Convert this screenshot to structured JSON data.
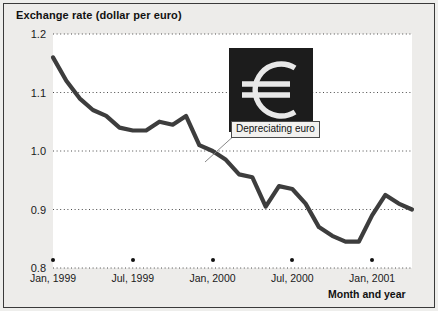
{
  "chart_data": {
    "type": "line",
    "title": "Exchange rate (dollar per euro)",
    "ylabel": "Exchange rate (dollar per euro)",
    "xlabel": "Month and year",
    "ylim": [
      0.8,
      1.2
    ],
    "yticks": [
      "0.8",
      "0.9",
      "1.0",
      "1.1",
      "1.2"
    ],
    "grid": true,
    "legend": "none",
    "xticks": [
      "Jan, 1999",
      "Jul, 1999",
      "Jan, 2000",
      "Jul, 2000",
      "Jan, 2001"
    ],
    "x": [
      "Jan, 1999",
      "Feb, 1999",
      "Mar, 1999",
      "Apr, 1999",
      "May, 1999",
      "Jun, 1999",
      "Jul, 1999",
      "Aug, 1999",
      "Sep, 1999",
      "Oct, 1999",
      "Nov, 1999",
      "Dec, 1999",
      "Jan, 2000",
      "Feb, 2000",
      "Mar, 2000",
      "Apr, 2000",
      "May, 2000",
      "Jun, 2000",
      "Jul, 2000",
      "Aug, 2000",
      "Sep, 2000",
      "Oct, 2000",
      "Nov, 2000",
      "Dec, 2000",
      "Jan, 2001",
      "Feb, 2001",
      "Mar, 2001",
      "Apr, 2001"
    ],
    "values": [
      1.16,
      1.12,
      1.09,
      1.07,
      1.06,
      1.04,
      1.035,
      1.035,
      1.05,
      1.045,
      1.06,
      1.01,
      1.0,
      0.985,
      0.96,
      0.955,
      0.905,
      0.94,
      0.935,
      0.91,
      0.87,
      0.855,
      0.845,
      0.845,
      0.89,
      0.925,
      0.91,
      0.9
    ],
    "annotation": {
      "label": "Depreciating euro",
      "icon": "euro-symbol"
    }
  },
  "annotation": {
    "caption": "Depreciating euro",
    "euro_glyph": "€"
  },
  "axes": {
    "y_title": "Exchange rate (dollar per euro)",
    "x_title": "Month and year"
  },
  "colors": {
    "line": "#3d3d3d",
    "grid": "#4a4a4a",
    "euro_box_bg": "#1c1c1c",
    "euro_glyph": "#e8e8e8",
    "figure_bg": "#edecea",
    "plot_bg": "#ffffff",
    "text": "#111111"
  }
}
